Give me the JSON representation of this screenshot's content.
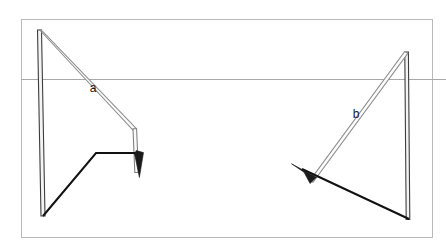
{
  "figure": {
    "background_color": "#ffffff",
    "frame": {
      "name": "outer-frame",
      "color": "#b9b9b9",
      "stroke_width": 1,
      "x": 21,
      "y": 19,
      "width": 412,
      "height": 219
    },
    "reference_line": {
      "name": "horizontal-reference-line",
      "color": "#a8a8a8",
      "stroke_width": 1,
      "x1": 21,
      "y1": 79,
      "x2": 446,
      "y2": 79
    },
    "labels": [
      {
        "id": "label-a",
        "text": "a",
        "x": 93,
        "y": 92,
        "color": "#1a1a1a",
        "font_size": 12
      },
      {
        "id": "label-b",
        "text": "b",
        "x": 356,
        "y": 118,
        "color": "#1a1a1a",
        "font_size": 12
      }
    ],
    "left_assembly": {
      "name": "left-rod-assembly",
      "vertical_rod": {
        "name": "left-vertical-rod",
        "x1": 39,
        "y1": 30,
        "x2": 43,
        "y2": 216,
        "outline_color": "#3c3c3c",
        "fill_color": "#f2f2f2",
        "width": 3
      },
      "diagonal_rod_a": {
        "name": "left-diagonal-rod-a",
        "x1": 39,
        "y1": 30,
        "x2": 134,
        "y2": 129,
        "outline_color": "#8a8a8a",
        "fill_color": "#fbfbfb",
        "width": 3
      },
      "short_rod": {
        "name": "left-short-vertical-rod",
        "x1": 134,
        "y1": 129,
        "x2": 137,
        "y2": 171,
        "outline_color": "#7c7c7c",
        "fill_color": "#fafafa",
        "width": 3
      },
      "arrow_vector": {
        "name": "left-arrow-vector",
        "points": "43,216 96,153 138,153",
        "color": "#111111",
        "stroke_width": 2,
        "arrow_tip_x": 138,
        "arrow_tip_y": 153
      },
      "arrow_head": {
        "name": "left-arrowhead",
        "points": "139,149 144,162 136,176 136,153",
        "color": "#1b1b1b"
      }
    },
    "right_assembly": {
      "name": "right-rod-assembly",
      "vertical_rod": {
        "name": "right-vertical-rod",
        "x1": 406,
        "y1": 52,
        "x2": 409,
        "y2": 219,
        "outline_color": "#3c3c3c",
        "fill_color": "#f2f2f2",
        "width": 3
      },
      "diagonal_rod_b": {
        "name": "right-diagonal-rod-b",
        "x1": 406,
        "y1": 52,
        "x2": 311,
        "y2": 181,
        "outline_color": "#8a8a8a",
        "fill_color": "#fbfbfb",
        "width": 3
      },
      "arrow_vector": {
        "name": "right-arrow-vector",
        "points": "409,219 295,165",
        "color": "#111111",
        "stroke_width": 2,
        "arrow_tip_x": 295,
        "arrow_tip_y": 165
      },
      "arrow_head": {
        "name": "right-arrowhead",
        "points": "292,165 318,178 311,183 305,173"
      }
    }
  }
}
